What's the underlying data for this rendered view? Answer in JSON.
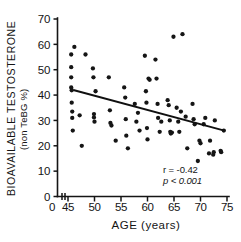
{
  "chart_data": {
    "type": "scatter",
    "title": "",
    "xlabel": "AGE (years)",
    "ylabel": "BIOAVAILABLE TESTOSTERONE",
    "ylabel_sub": "(non TeBG %)",
    "xlim": [
      45,
      75
    ],
    "ylim": [
      0,
      70
    ],
    "xticks": [
      45,
      50,
      55,
      60,
      65,
      70,
      75
    ],
    "xtick_labels": [
      "45",
      "50",
      "55",
      "60",
      "65",
      "70",
      "75"
    ],
    "x_origin_label": "0",
    "yticks": [
      0,
      10,
      20,
      30,
      40,
      50,
      60,
      70
    ],
    "ytick_labels": [
      "0",
      "10",
      "20",
      "30",
      "40",
      "50",
      "60",
      "70"
    ],
    "grid": false,
    "legend": false,
    "axis_break_x": true,
    "point_color": "#151515",
    "line_color": "#101010",
    "annotations": [
      {
        "name": "correlation",
        "text": "r = -0.42"
      },
      {
        "name": "p-value",
        "text": "p < 0.001"
      }
    ],
    "statistics": {
      "r": -0.42,
      "p_text": "p < 0.001"
    },
    "trend_line": {
      "x_start": 46,
      "y_start": 42,
      "x_end": 74.5,
      "y_end": 26
    },
    "points": [
      [
        45.6,
        56.0
      ],
      [
        45.6,
        51.0
      ],
      [
        45.6,
        47.0
      ],
      [
        45.6,
        43.0
      ],
      [
        45.7,
        41.9
      ],
      [
        45.7,
        37.0
      ],
      [
        45.8,
        33.5
      ],
      [
        45.8,
        31.0
      ],
      [
        45.9,
        26.0
      ],
      [
        46.2,
        59.0
      ],
      [
        47.2,
        32.0
      ],
      [
        47.6,
        20.0
      ],
      [
        48.3,
        56.0
      ],
      [
        49.7,
        50.5
      ],
      [
        49.8,
        47.0
      ],
      [
        49.9,
        32.5
      ],
      [
        49.9,
        31.2
      ],
      [
        50.0,
        29.5
      ],
      [
        50.2,
        41.5
      ],
      [
        52.7,
        47.0
      ],
      [
        52.9,
        34.0
      ],
      [
        53.0,
        29.0
      ],
      [
        53.2,
        28.0
      ],
      [
        54.0,
        22.0
      ],
      [
        55.6,
        43.0
      ],
      [
        55.8,
        39.0
      ],
      [
        55.9,
        30.5
      ],
      [
        56.0,
        24.0
      ],
      [
        56.3,
        19.0
      ],
      [
        57.6,
        36.5
      ],
      [
        57.9,
        29.5
      ],
      [
        58.2,
        33.0
      ],
      [
        58.5,
        26.0
      ],
      [
        59.5,
        55.5
      ],
      [
        59.7,
        41.5
      ],
      [
        59.8,
        37.0
      ],
      [
        59.9,
        27.0
      ],
      [
        60.0,
        22.5
      ],
      [
        60.2,
        46.5
      ],
      [
        60.4,
        46.0
      ],
      [
        61.5,
        54.0
      ],
      [
        61.7,
        46.5
      ],
      [
        61.9,
        36.5
      ],
      [
        62.0,
        31.0
      ],
      [
        62.3,
        25.5
      ],
      [
        62.6,
        29.5
      ],
      [
        63.8,
        38.0
      ],
      [
        64.0,
        36.0
      ],
      [
        64.2,
        30.0
      ],
      [
        64.3,
        25.5
      ],
      [
        64.4,
        24.8
      ],
      [
        64.6,
        25.2
      ],
      [
        64.9,
        63.0
      ],
      [
        65.5,
        35.0
      ],
      [
        65.8,
        29.5
      ],
      [
        66.0,
        25.5
      ],
      [
        66.3,
        33.5
      ],
      [
        66.6,
        64.0
      ],
      [
        67.2,
        31.5
      ],
      [
        67.5,
        19.0
      ],
      [
        68.5,
        36.5
      ],
      [
        68.7,
        30.5
      ],
      [
        68.9,
        28.5
      ],
      [
        69.5,
        14.0
      ],
      [
        69.8,
        22.0
      ],
      [
        70.0,
        21.0
      ],
      [
        70.6,
        28.5
      ],
      [
        70.9,
        31.0
      ],
      [
        71.6,
        17.0
      ],
      [
        71.8,
        22.0
      ],
      [
        72.4,
        16.5
      ],
      [
        72.5,
        17.5
      ],
      [
        72.7,
        30.0
      ],
      [
        73.8,
        18.0
      ],
      [
        73.9,
        17.5
      ],
      [
        74.4,
        26.0
      ]
    ]
  }
}
